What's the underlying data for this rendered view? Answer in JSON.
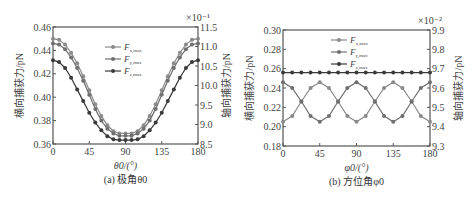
{
  "chart_data": [
    {
      "type": "line",
      "panel_caption": "(a) 极角θ0",
      "xlabel": "θ0/(°)",
      "ylabel_left": "横向捕获力/pN",
      "ylabel_right": "轴向捕获力/pN",
      "right_axis_multiplier": "×10⁻¹",
      "xlim": [
        0,
        180
      ],
      "ylim_left": [
        0.36,
        0.46
      ],
      "ylim_right": [
        8.5,
        11.5
      ],
      "xticks": [
        "0",
        "45",
        "90",
        "135",
        "180"
      ],
      "yticks_left": [
        "0.46",
        "0.44",
        "0.42",
        "0.40",
        "0.38",
        "0.36"
      ],
      "yticks_right": [
        "11.5",
        "11.0",
        "10.5",
        "10.0",
        "9.5",
        "9.0",
        "8.5"
      ],
      "grid": false,
      "legend_position": "upper center",
      "x": [
        0,
        7.5,
        15,
        22.5,
        30,
        37.5,
        45,
        52.5,
        60,
        67.5,
        75,
        82.5,
        90,
        97.5,
        105,
        112.5,
        120,
        127.5,
        135,
        142.5,
        150,
        157.5,
        165,
        172.5,
        180
      ],
      "series": [
        {
          "name": "F_x,max",
          "axis": "left",
          "color": "#8a8a8a",
          "values": [
            0.45,
            0.449,
            0.445,
            0.438,
            0.429,
            0.418,
            0.406,
            0.394,
            0.384,
            0.376,
            0.371,
            0.369,
            0.369,
            0.369,
            0.371,
            0.376,
            0.384,
            0.394,
            0.406,
            0.418,
            0.429,
            0.438,
            0.445,
            0.449,
            0.45
          ]
        },
        {
          "name": "F_y,max",
          "axis": "left",
          "color": "#6f6f6f",
          "values": [
            0.446,
            0.445,
            0.441,
            0.434,
            0.425,
            0.414,
            0.402,
            0.39,
            0.38,
            0.373,
            0.369,
            0.367,
            0.367,
            0.367,
            0.369,
            0.373,
            0.38,
            0.39,
            0.402,
            0.414,
            0.425,
            0.434,
            0.441,
            0.445,
            0.446
          ]
        },
        {
          "name": "F_z,max",
          "axis": "right",
          "color": "#3a3a3a",
          "values": [
            10.65,
            10.6,
            10.45,
            10.2,
            9.9,
            9.6,
            9.3,
            9.05,
            8.85,
            8.7,
            8.62,
            8.6,
            8.6,
            8.6,
            8.62,
            8.7,
            8.85,
            9.05,
            9.3,
            9.6,
            9.9,
            10.2,
            10.45,
            10.6,
            10.65
          ]
        }
      ]
    },
    {
      "type": "line",
      "panel_caption": "(b) 方位角φ0",
      "xlabel": "φ0/(°)",
      "ylabel_left": "横向捕获力/pN",
      "ylabel_right": "轴向捕获力/pN",
      "right_axis_multiplier": "×10⁻²",
      "xlim": [
        0,
        180
      ],
      "ylim_left": [
        0.18,
        0.3
      ],
      "ylim_right": [
        9.3,
        9.9
      ],
      "xticks": [
        "0",
        "45",
        "90",
        "135",
        "180"
      ],
      "yticks_left": [
        "0.30",
        "0.28",
        "0.26",
        "0.24",
        "0.22",
        "0.20",
        "0.18"
      ],
      "yticks_right": [
        "9.9",
        "9.8",
        "9.7",
        "9.6",
        "9.5",
        "9.4",
        "9.3"
      ],
      "grid": false,
      "legend_position": "upper center",
      "x": [
        0,
        11.25,
        22.5,
        33.75,
        45,
        56.25,
        67.5,
        78.75,
        90,
        101.25,
        112.5,
        123.75,
        135,
        146.25,
        157.5,
        168.75,
        180
      ],
      "series": [
        {
          "name": "F_x,max",
          "axis": "left",
          "color": "#8a8a8a",
          "values": [
            0.205,
            0.211,
            0.226,
            0.24,
            0.246,
            0.24,
            0.226,
            0.211,
            0.205,
            0.211,
            0.226,
            0.24,
            0.246,
            0.24,
            0.226,
            0.211,
            0.205
          ]
        },
        {
          "name": "F_y,max",
          "axis": "left",
          "color": "#6f6f6f",
          "values": [
            0.246,
            0.24,
            0.226,
            0.211,
            0.205,
            0.211,
            0.226,
            0.24,
            0.246,
            0.24,
            0.226,
            0.211,
            0.205,
            0.211,
            0.226,
            0.24,
            0.246
          ]
        },
        {
          "name": "F_z,max",
          "axis": "right",
          "color": "#3a3a3a",
          "values": [
            9.68,
            9.68,
            9.68,
            9.68,
            9.68,
            9.68,
            9.68,
            9.68,
            9.68,
            9.68,
            9.68,
            9.68,
            9.68,
            9.68,
            9.68,
            9.68,
            9.68
          ]
        }
      ]
    }
  ],
  "legend": {
    "entries": [
      {
        "main": "F",
        "sub": "x,max"
      },
      {
        "main": "F",
        "sub": "y,max"
      },
      {
        "main": "F",
        "sub": "z,max"
      }
    ]
  },
  "panels": [
    {
      "caption": "(a) 极角θ0",
      "xlabel": "θ0/(°)",
      "multiplier": "×10⁻¹"
    },
    {
      "caption": "(b) 方位角φ0",
      "xlabel": "φ0/(°)",
      "multiplier": "×10⁻²"
    }
  ]
}
